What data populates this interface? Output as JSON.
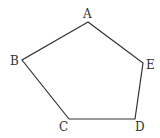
{
  "figure": {
    "shape": "pentagon",
    "stroke_color": "#333333",
    "vertices": [
      {
        "label": "A",
        "x": 88,
        "y": 22,
        "lx": 86,
        "ly": 18
      },
      {
        "label": "B",
        "x": 22,
        "y": 60,
        "lx": 10,
        "ly": 65
      },
      {
        "label": "C",
        "x": 69,
        "y": 119,
        "lx": 59,
        "ly": 131
      },
      {
        "label": "D",
        "x": 135,
        "y": 119,
        "lx": 135,
        "ly": 131
      },
      {
        "label": "E",
        "x": 143,
        "y": 63,
        "lx": 146,
        "ly": 69
      }
    ]
  }
}
